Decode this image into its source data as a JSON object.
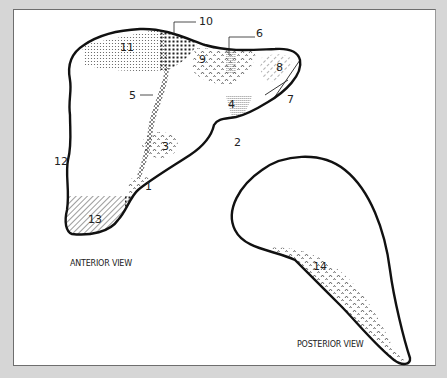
{
  "diagram": {
    "views": {
      "anterior": "ANTERIOR VIEW",
      "posterior": "POSTERIOR VIEW"
    },
    "labels": [
      {
        "id": "1",
        "text": "1"
      },
      {
        "id": "2",
        "text": "2"
      },
      {
        "id": "3",
        "text": "3"
      },
      {
        "id": "4",
        "text": "4"
      },
      {
        "id": "5",
        "text": "5"
      },
      {
        "id": "6",
        "text": "6"
      },
      {
        "id": "7",
        "text": "7"
      },
      {
        "id": "8",
        "text": "8"
      },
      {
        "id": "9",
        "text": "9"
      },
      {
        "id": "10",
        "text": "10"
      },
      {
        "id": "11",
        "text": "11"
      },
      {
        "id": "12",
        "text": "12"
      },
      {
        "id": "13",
        "text": "13"
      },
      {
        "id": "14",
        "text": "14"
      }
    ],
    "colors": {
      "background": "#d6d6d6",
      "panel": "#ffffff",
      "outline": "#111111",
      "pattern": "#444444"
    }
  }
}
